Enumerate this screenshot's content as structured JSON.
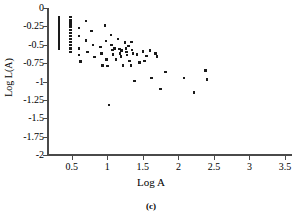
{
  "figure": {
    "caption": "(c)"
  },
  "chart_data": {
    "type": "scatter",
    "title": "",
    "xlabel": "Log A",
    "ylabel": "Log L(A)",
    "xlim": [
      0.15,
      3.6
    ],
    "ylim": [
      -2,
      0
    ],
    "grid": false,
    "legend": null,
    "marker": "square",
    "marker_color": "#1a1a1a",
    "xticks": [
      0.5,
      1,
      1.5,
      2,
      2.5,
      3,
      3.5
    ],
    "xticklabels": [
      "0.5",
      "1",
      "1.5",
      "2",
      "2.5",
      "3",
      "3.5"
    ],
    "yticks": [
      0,
      -0.25,
      -0.5,
      -0.75,
      -1,
      -1.25,
      -1.5,
      -1.75,
      -2
    ],
    "yticklabels": [
      "0",
      "-0.25",
      "-0.5",
      "-0.75",
      "-1",
      "-1.25",
      "-1.5",
      "-1.75",
      "-2"
    ],
    "points": [
      [
        0.32,
        -0.13
      ],
      [
        0.32,
        -0.17
      ],
      [
        0.32,
        -0.2
      ],
      [
        0.32,
        -0.24
      ],
      [
        0.32,
        -0.27
      ],
      [
        0.32,
        -0.3
      ],
      [
        0.32,
        -0.33
      ],
      [
        0.32,
        -0.36
      ],
      [
        0.32,
        -0.39
      ],
      [
        0.32,
        -0.42
      ],
      [
        0.32,
        -0.45
      ],
      [
        0.32,
        -0.48
      ],
      [
        0.32,
        -0.52
      ],
      [
        0.32,
        -0.55
      ],
      [
        0.48,
        -0.12
      ],
      [
        0.48,
        -0.16
      ],
      [
        0.48,
        -0.2
      ],
      [
        0.48,
        -0.23
      ],
      [
        0.48,
        -0.26
      ],
      [
        0.48,
        -0.3
      ],
      [
        0.48,
        -0.34
      ],
      [
        0.48,
        -0.38
      ],
      [
        0.48,
        -0.42
      ],
      [
        0.48,
        -0.46
      ],
      [
        0.48,
        -0.5
      ],
      [
        0.48,
        -0.55
      ],
      [
        0.48,
        -0.6
      ],
      [
        0.6,
        -0.27
      ],
      [
        0.6,
        -0.38
      ],
      [
        0.6,
        -0.55
      ],
      [
        0.6,
        -0.64
      ],
      [
        0.62,
        -0.73
      ],
      [
        0.7,
        -0.18
      ],
      [
        0.7,
        -0.44
      ],
      [
        0.72,
        -0.6
      ],
      [
        0.78,
        -0.31
      ],
      [
        0.8,
        -0.5
      ],
      [
        0.82,
        -0.67
      ],
      [
        0.9,
        -0.53
      ],
      [
        0.92,
        -0.62
      ],
      [
        0.93,
        -0.78
      ],
      [
        0.97,
        -0.24
      ],
      [
        0.98,
        -0.45
      ],
      [
        0.99,
        -0.7
      ],
      [
        1.0,
        -0.79
      ],
      [
        1.02,
        -1.32
      ],
      [
        1.05,
        -0.37
      ],
      [
        1.06,
        -0.5
      ],
      [
        1.07,
        -0.57
      ],
      [
        1.08,
        -0.63
      ],
      [
        1.1,
        -0.55
      ],
      [
        1.12,
        -0.7
      ],
      [
        1.15,
        -0.42
      ],
      [
        1.17,
        -0.56
      ],
      [
        1.18,
        -0.62
      ],
      [
        1.19,
        -0.66
      ],
      [
        1.2,
        -0.58
      ],
      [
        1.22,
        -0.78
      ],
      [
        1.25,
        -0.47
      ],
      [
        1.26,
        -0.55
      ],
      [
        1.27,
        -0.6
      ],
      [
        1.28,
        -0.64
      ],
      [
        1.3,
        -0.52
      ],
      [
        1.31,
        -0.72
      ],
      [
        1.33,
        -0.78
      ],
      [
        1.34,
        -0.46
      ],
      [
        1.35,
        -0.57
      ],
      [
        1.36,
        -0.62
      ],
      [
        1.38,
        -0.99
      ],
      [
        1.42,
        -0.63
      ],
      [
        1.45,
        -0.74
      ],
      [
        1.5,
        -0.59
      ],
      [
        1.52,
        -0.72
      ],
      [
        1.55,
        -0.65
      ],
      [
        1.6,
        -0.58
      ],
      [
        1.62,
        -0.95
      ],
      [
        1.68,
        -0.62
      ],
      [
        1.7,
        -0.66
      ],
      [
        1.75,
        -1.1
      ],
      [
        1.82,
        -0.87
      ],
      [
        2.08,
        -0.95
      ],
      [
        2.22,
        -1.15
      ],
      [
        2.38,
        -0.85
      ],
      [
        2.4,
        -0.97
      ]
    ]
  }
}
